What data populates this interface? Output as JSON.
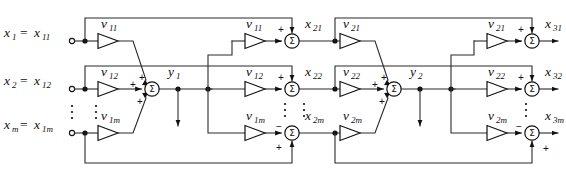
{
  "figure": {
    "type": "signal-flow-diagram",
    "width": 566,
    "height": 180,
    "background_color": "#ffffff",
    "line_color": "#2b2b2b",
    "glyphs": {
      "summation": "Σ",
      "plus": "+",
      "minus": "−",
      "vdots": "⋮"
    }
  },
  "inputs": [
    {
      "name": "input-x1",
      "label_main": "x",
      "label_main_sub": "1",
      "equals": "=",
      "label_alias": "x",
      "label_alias_sub": "11",
      "row": "top"
    },
    {
      "name": "input-x2",
      "label_main": "x",
      "label_main_sub": "2",
      "equals": "=",
      "label_alias": "x",
      "label_alias_sub": "12",
      "row": "middle"
    },
    {
      "name": "input-xm",
      "label_main": "x",
      "label_main_sub": "m",
      "equals": "=",
      "label_alias": "x",
      "label_alias_sub": "1m",
      "row": "bottom"
    }
  ],
  "layer1": {
    "name": "layer-1",
    "weights": [
      {
        "name": "weight-v11",
        "symbol": "v",
        "sub": "11",
        "row": "top"
      },
      {
        "name": "weight-v12",
        "symbol": "v",
        "sub": "12",
        "row": "middle"
      },
      {
        "name": "weight-v1m",
        "symbol": "v",
        "sub": "1m",
        "row": "bottom"
      }
    ],
    "summing_junction": {
      "name": "sum-y1",
      "symbol": "Σ",
      "input_signs": [
        "+",
        "+",
        "+"
      ],
      "output_label": "y",
      "output_sub": "1"
    }
  },
  "layer2": {
    "name": "layer-2",
    "weights": [
      {
        "name": "weight-v11-b",
        "symbol": "v",
        "sub": "11",
        "row": "top"
      },
      {
        "name": "weight-v12-b",
        "symbol": "v",
        "sub": "12",
        "row": "middle"
      },
      {
        "name": "weight-v1m-b",
        "symbol": "v",
        "sub": "1m",
        "row": "bottom"
      }
    ],
    "summing_junctions": [
      {
        "name": "sum-x21",
        "symbol": "Σ",
        "sign_top": "+",
        "sign_left": "−",
        "output_label": "x",
        "output_sub": "21",
        "row": "top"
      },
      {
        "name": "sum-x22",
        "symbol": "Σ",
        "sign_top": "+",
        "sign_left": "−",
        "output_label": "x",
        "output_sub": "22",
        "row": "middle"
      },
      {
        "name": "sum-x2m",
        "symbol": "Σ",
        "sign_bottom": "+",
        "sign_left": "−",
        "output_label": "x",
        "output_sub": "2m",
        "row": "bottom"
      }
    ]
  },
  "layer3": {
    "name": "layer-3",
    "weights": [
      {
        "name": "weight-v21",
        "symbol": "v",
        "sub": "21",
        "row": "top"
      },
      {
        "name": "weight-v22",
        "symbol": "v",
        "sub": "22",
        "row": "middle"
      },
      {
        "name": "weight-v2m",
        "symbol": "v",
        "sub": "2m",
        "row": "bottom"
      }
    ],
    "summing_junction": {
      "name": "sum-y2",
      "symbol": "Σ",
      "input_signs": [
        "+",
        "+",
        "+"
      ],
      "output_label": "y",
      "output_sub": "2"
    }
  },
  "layer4": {
    "name": "layer-4",
    "weights": [
      {
        "name": "weight-v21-b",
        "symbol": "v",
        "sub": "21",
        "row": "top"
      },
      {
        "name": "weight-v22-b",
        "symbol": "v",
        "sub": "22",
        "row": "middle"
      },
      {
        "name": "weight-v2m-b",
        "symbol": "v",
        "sub": "2m",
        "row": "bottom"
      }
    ],
    "summing_junctions": [
      {
        "name": "sum-x31",
        "symbol": "Σ",
        "sign_top": "+",
        "sign_left": "−",
        "output_label": "x",
        "output_sub": "31",
        "row": "top"
      },
      {
        "name": "sum-x32",
        "symbol": "Σ",
        "sign_top": "+",
        "sign_left": "−",
        "output_label": "x",
        "output_sub": "32",
        "row": "middle"
      },
      {
        "name": "sum-x3m",
        "symbol": "Σ",
        "sign_bottom": "+",
        "sign_left": "−",
        "output_label": "x",
        "output_sub": "3m",
        "row": "bottom"
      }
    ]
  },
  "outputs": [
    {
      "name": "output-x31",
      "label": "x",
      "sub": "31",
      "row": "top"
    },
    {
      "name": "output-x32",
      "label": "x",
      "sub": "32",
      "row": "middle"
    },
    {
      "name": "output-x3m",
      "label": "x",
      "sub": "3m",
      "row": "bottom"
    }
  ],
  "intermediate_labels": [
    {
      "name": "label-x21",
      "label": "x",
      "sub": "21"
    },
    {
      "name": "label-x22",
      "label": "x",
      "sub": "22"
    },
    {
      "name": "label-x2m",
      "label": "x",
      "sub": "2m"
    },
    {
      "name": "label-y1",
      "label": "y",
      "sub": "1"
    },
    {
      "name": "label-y2",
      "label": "y",
      "sub": "2"
    }
  ],
  "ellipses": [
    {
      "name": "vdots-input-column",
      "glyph": "⋮"
    },
    {
      "name": "vdots-weight-column-1",
      "glyph": "⋮"
    },
    {
      "name": "vdots-x2-column",
      "glyph": "⋮"
    },
    {
      "name": "vdots-weight-column-2",
      "glyph": "⋮"
    },
    {
      "name": "vdots-x3-column",
      "glyph": "⋮"
    }
  ]
}
